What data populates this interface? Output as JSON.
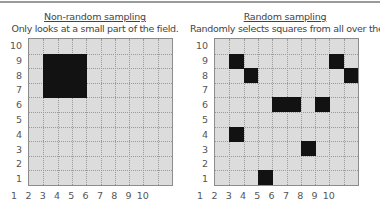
{
  "panels": [
    {
      "title": "Non-random sampling",
      "subtitle": "Only looks at a small part of the field.",
      "grid_left": 28,
      "filled_cells": [
        [
          2,
          9
        ],
        [
          3,
          9
        ],
        [
          4,
          9
        ],
        [
          2,
          8
        ],
        [
          3,
          8
        ],
        [
          4,
          8
        ],
        [
          2,
          7
        ],
        [
          3,
          7
        ],
        [
          4,
          7
        ]
      ]
    },
    {
      "title": "Random sampling",
      "subtitle": "Randomly selects squares from all over the field.",
      "grid_left": 214,
      "filled_cells": [
        [
          2,
          9
        ],
        [
          9,
          9
        ],
        [
          3,
          8
        ],
        [
          10,
          8
        ],
        [
          5,
          6
        ],
        [
          6,
          6
        ],
        [
          8,
          6
        ],
        [
          2,
          4
        ],
        [
          7,
          3
        ],
        [
          4,
          1
        ]
      ]
    }
  ],
  "axis": {
    "x_ticks": [
      "1",
      "2",
      "3",
      "4",
      "5",
      "6",
      "7",
      "8",
      "9",
      "10"
    ],
    "y_ticks": [
      "10",
      "9",
      "8",
      "7",
      "6",
      "5",
      "4",
      "3",
      "2",
      "1"
    ]
  },
  "colors": {
    "field": "#dcdcdc",
    "sampled": "#121212",
    "gridline": "#9a9a9a"
  }
}
